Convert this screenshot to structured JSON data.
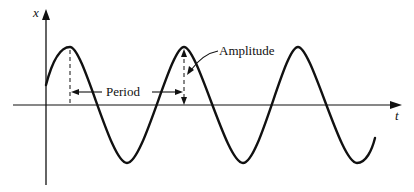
{
  "diagram": {
    "axes": {
      "y_label": "x",
      "x_label": "t"
    },
    "annotations": {
      "period_label": "Period",
      "amplitude_label": "Amplitude"
    },
    "colors": {
      "ink": "#111111",
      "background": "#ffffff"
    }
  }
}
